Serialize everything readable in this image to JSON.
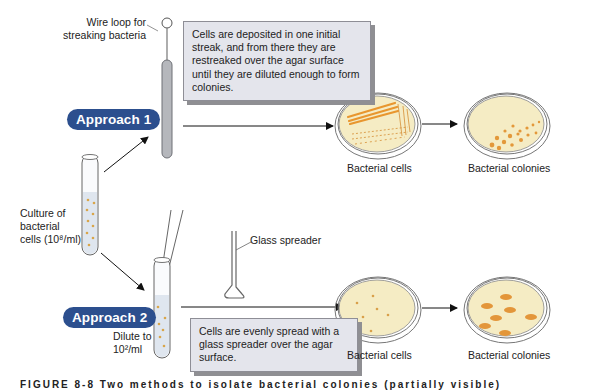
{
  "labels": {
    "wire_loop": [
      "Wire loop for",
      "streaking bacteria"
    ],
    "culture": [
      "Culture of",
      "bacterial",
      "cells (10⁸/ml)"
    ],
    "glass_spreader": "Glass spreader",
    "dilute": [
      "Dilute to",
      "10²/ml"
    ]
  },
  "approaches": [
    {
      "label": "Approach 1",
      "note": "Cells are deposited in one initial streak, and from there they are restreaked over the agar surface until they are diluted enough to form colonies.",
      "plate_before_label": "Bacterial cells",
      "plate_after_label": "Bacterial colonies"
    },
    {
      "label": "Approach 2",
      "note": "Cells are evenly spread with a glass spreader over the agar surface.",
      "plate_before_label": "Bacterial cells",
      "plate_after_label": "Bacterial colonies"
    }
  ],
  "caption": "FIGURE 8-8  Two methods to isolate bacterial colonies (partially visible)",
  "colors": {
    "pill": "#2c4f8e",
    "agar": "#f5ecc4",
    "colony": "#e09a36",
    "note_bg": "#e4e5ec",
    "tube_liquid": "#dfe6ef"
  }
}
